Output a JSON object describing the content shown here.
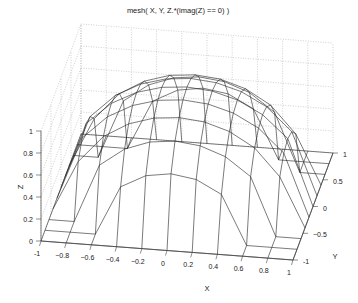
{
  "chart_data": {
    "type": "mesh3d",
    "title": "mesh( X,  Y,  Z.*(imag(Z) == 0) )",
    "xlabel": "X",
    "ylabel": "Y",
    "zlabel": "Z",
    "xlim": [
      -1,
      1
    ],
    "ylim": [
      -1,
      1
    ],
    "zlim": [
      0,
      1
    ],
    "xticks": [
      -1,
      -0.8,
      -0.6,
      -0.4,
      -0.2,
      0,
      0.2,
      0.4,
      0.6,
      0.8,
      1
    ],
    "xtick_labels": [
      "-1",
      "−0.8",
      "−0.6",
      "−0.4",
      "−0.2",
      "0",
      "0.2",
      "0.4",
      "0.6",
      "0.8",
      "1"
    ],
    "yticks": [
      -1,
      -0.5,
      0,
      0.5,
      1
    ],
    "ytick_labels": [
      "-1",
      "−0.5",
      "0",
      "0.5",
      "1"
    ],
    "zticks": [
      0,
      0.2,
      0.4,
      0.6,
      0.8,
      1
    ],
    "ztick_labels": [
      "0",
      "0.2",
      "0.4",
      "0.6",
      "0.8",
      "1"
    ],
    "grid": true,
    "surface": "Z = sqrt(1 - X.^2 - Y.^2), zeroed where complex",
    "grid_points": 11,
    "line_color": "#222222",
    "grid_color": "#b0b0b0",
    "background": "#ffffff"
  },
  "projection": {
    "origin": [
      41,
      241
    ],
    "ex": [
      126,
      9.5
    ],
    "ey": [
      20,
      -53.5
    ],
    "ez": [
      0,
      -110
    ]
  }
}
